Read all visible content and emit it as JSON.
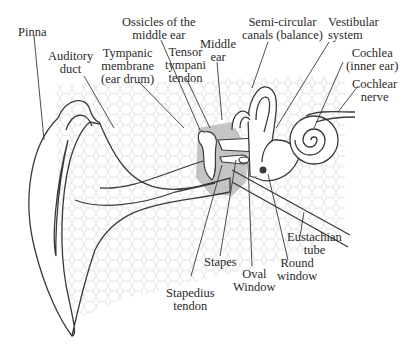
{
  "colors": {
    "line": "#3a3a3a",
    "hex_pattern": "#d8d8d8",
    "middle_ear_shade": "#bdbdbd",
    "text": "#2a2a2a"
  },
  "labels": {
    "pinna": [
      "Pinna"
    ],
    "auditory_duct": [
      "Auditory",
      "duct"
    ],
    "tympanic_membrane": [
      "Tympanic",
      "membrane",
      "(ear drum)"
    ],
    "ossicles": [
      "Ossicles of the",
      "middle ear"
    ],
    "tensor_tympani": [
      "Tensor",
      "tympani",
      "tendon"
    ],
    "middle_ear": [
      "Middle",
      "ear"
    ],
    "semicircular_canals": [
      "Semi-circular",
      "canals (balance)"
    ],
    "vestibular_system": [
      "Vestibular",
      "system"
    ],
    "cochlea": [
      "Cochlea",
      "(inner ear)"
    ],
    "cochlear_nerve": [
      "Cochlear",
      "nerve"
    ],
    "eustachian_tube": [
      "Eustachian",
      "tube"
    ],
    "round_window": [
      "Round",
      "window"
    ],
    "oval_window": [
      "Oval",
      "Window"
    ],
    "stapes": [
      "Stapes"
    ],
    "stapedius_tendon": [
      "Stapedius",
      "tendon"
    ]
  }
}
